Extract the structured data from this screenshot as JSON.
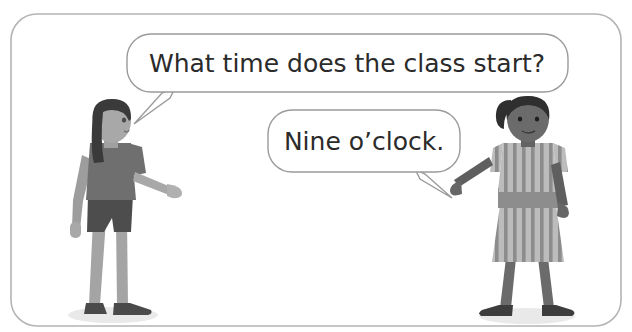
{
  "scene": {
    "title": "Illustrated dialogue: two children talking",
    "background_color": "#ffffff",
    "width": 632,
    "height": 332
  },
  "frame": {
    "name": "rounded-panel-border",
    "stroke_color": "#b4b4b4",
    "corner_radius": 26
  },
  "bubbles": [
    {
      "id": "question",
      "speaker": "left-child",
      "text": "What time does the class start?",
      "x": 127,
      "y": 34,
      "width": 441,
      "height": 58,
      "corner_radius": 24,
      "font_size": 25,
      "fill": "#ffffff",
      "stroke": "#9a9a9a",
      "tail_direction": "down-left"
    },
    {
      "id": "answer",
      "speaker": "right-child",
      "text": "Nine o’clock.",
      "x": 268,
      "y": 110,
      "width": 192,
      "height": 62,
      "corner_radius": 24,
      "font_size": 25,
      "fill": "#ffffff",
      "stroke": "#9a9a9a",
      "tail_direction": "down-right"
    }
  ],
  "characters": [
    {
      "id": "left-child",
      "label": "boy with long dark hair",
      "position": "left",
      "facing": "right-profile",
      "hair_color": "#3a3a3a",
      "skin_color": "#a8a8a8",
      "shirt_color": "#6f6f6f",
      "shorts_color": "#4d4d4d",
      "shoe_color": "#4a4a4a",
      "shadow_color": "#e8e8e8"
    },
    {
      "id": "right-child",
      "label": "girl with ponytail in striped dress",
      "position": "right",
      "facing": "front",
      "hair_color": "#2f2f2f",
      "skin_color": "#6b6b6b",
      "dress_base_color": "#b9b9b9",
      "dress_stripe_color": "#8a8a8a",
      "belt_color": "#8d8d8d",
      "shoe_color": "#3d3d3d",
      "shadow_color": "#e8e8e8"
    }
  ]
}
